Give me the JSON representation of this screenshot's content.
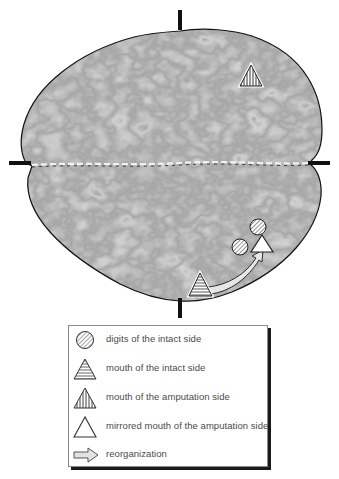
{
  "figure": {
    "type": "brain-surface-map",
    "view": "axial top-down cortical surface, grayscale rendering",
    "crosshair_marks": [
      "top",
      "bottom",
      "left",
      "right"
    ],
    "markers": [
      {
        "id": "digits-intact-1",
        "symbol": "circle-diagonal-hatch",
        "meaning": "digits of the intact side"
      },
      {
        "id": "digits-intact-2",
        "symbol": "circle-diagonal-hatch",
        "meaning": "digits of the intact side"
      },
      {
        "id": "mirrored-mouth",
        "symbol": "triangle-open",
        "meaning": "mirrored mouth of the amputation side"
      },
      {
        "id": "mouth-amputation",
        "symbol": "triangle-vertical-stripes",
        "meaning": "mouth of the amputation side"
      },
      {
        "id": "mouth-intact",
        "symbol": "triangle-horizontal-stripes",
        "meaning": "mouth of the intact side"
      },
      {
        "id": "reorganization-arrow",
        "symbol": "curved-arrow",
        "meaning": "reorganization"
      }
    ]
  },
  "legend": {
    "items": [
      {
        "icon": "circle-diagonal-hatch-icon",
        "label": "digits of the intact side"
      },
      {
        "icon": "triangle-horizontal-stripes-icon",
        "label": "mouth of the intact side"
      },
      {
        "icon": "triangle-vertical-stripes-icon",
        "label": "mouth of the amputation side"
      },
      {
        "icon": "triangle-open-icon",
        "label": "mirrored mouth of the amputation side"
      },
      {
        "icon": "arrow-icon",
        "label": "reorganization"
      }
    ]
  },
  "colors": {
    "outline": "#111111",
    "marker_stroke": "#2a2a2a",
    "marker_fill": "#ffffff",
    "arrow_fill": "#e6e6e6",
    "legend_text": "#4a4a4a",
    "legend_shadow": "#1a1a1a"
  }
}
